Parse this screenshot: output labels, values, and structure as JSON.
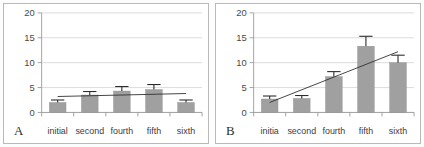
{
  "figure": {
    "panel_letters": [
      "A",
      "B"
    ],
    "bar_color": "#a0a0a0",
    "line_color": "#2f2f2f",
    "grid_color": "#d2d2d2",
    "axis_color": "#9a9a9a"
  },
  "chart_data": [
    {
      "type": "bar",
      "panel": "A",
      "title": "",
      "xlabel": "",
      "ylabel": "",
      "categories": [
        "initial",
        "second",
        "fourth",
        "fifth",
        "sixth"
      ],
      "values": [
        2.0,
        3.5,
        4.3,
        4.6,
        2.0
      ],
      "errors": [
        0.5,
        0.7,
        0.9,
        1.0,
        0.5
      ],
      "ylim": [
        0,
        20
      ],
      "yticks": [
        0,
        5,
        10,
        15,
        20
      ],
      "ytick_labels": [
        "0",
        "5",
        "10",
        "15",
        "20"
      ],
      "grid": true,
      "legend": "none",
      "trendline": {
        "x_start_value": 3.2,
        "x_end_value": 3.8,
        "style": "solid"
      }
    },
    {
      "type": "bar",
      "panel": "B",
      "title": "",
      "xlabel": "",
      "ylabel": "",
      "categories": [
        "initia",
        "second",
        "fourth",
        "fifth",
        "sixth"
      ],
      "values": [
        2.7,
        2.8,
        7.2,
        13.3,
        10.0
      ],
      "errors": [
        0.6,
        0.6,
        1.0,
        2.0,
        1.5
      ],
      "ylim": [
        0,
        20
      ],
      "yticks": [
        0,
        5,
        10,
        15,
        20
      ],
      "ytick_labels": [
        "20",
        "15",
        "10",
        "5",
        "0"
      ],
      "grid": true,
      "legend": "none",
      "trendline": {
        "x_start_value": 2.0,
        "x_end_value": 12.2,
        "style": "solid"
      }
    }
  ]
}
